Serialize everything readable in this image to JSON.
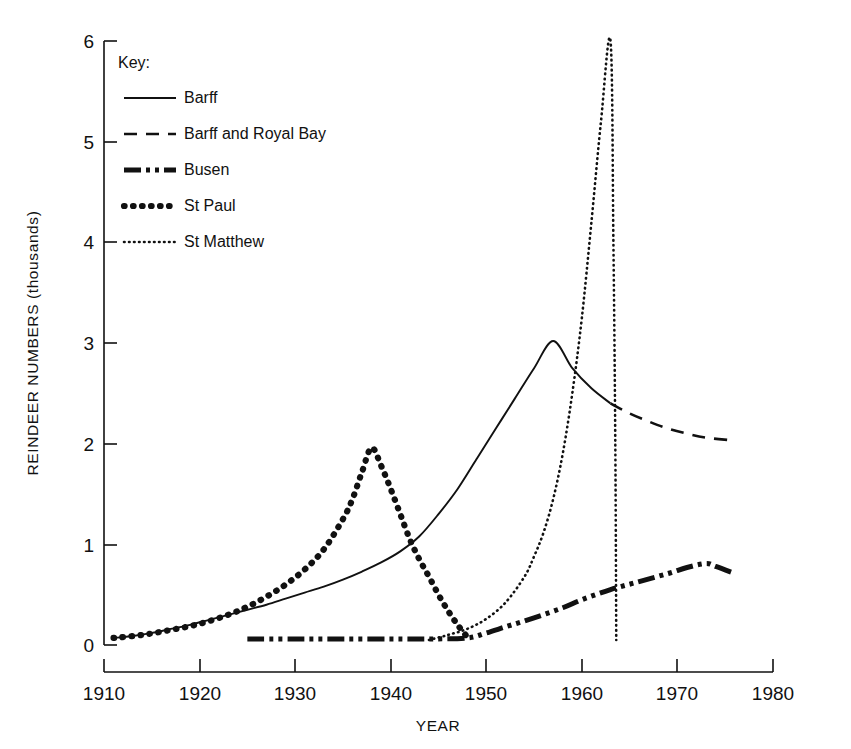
{
  "chart_data": {
    "type": "line",
    "title": "",
    "xlabel": "YEAR",
    "ylabel": "REINDEER NUMBERS (thousands)",
    "xlim": [
      1910,
      1980
    ],
    "ylim": [
      0,
      6
    ],
    "xticks": [
      "1910",
      "1920",
      "1930",
      "1940",
      "1950",
      "1960",
      "1970",
      "1980"
    ],
    "yticks": [
      "0",
      "1",
      "2",
      "3",
      "4",
      "5",
      "6"
    ],
    "grid": false,
    "legend_position": "upper-left-inside",
    "legend_title": "Key:",
    "series": [
      {
        "name": "Barff",
        "style": "solid",
        "points": [
          [
            1911,
            0.07
          ],
          [
            1913,
            0.09
          ],
          [
            1915,
            0.12
          ],
          [
            1917,
            0.16
          ],
          [
            1919,
            0.2
          ],
          [
            1921,
            0.25
          ],
          [
            1923,
            0.3
          ],
          [
            1925,
            0.35
          ],
          [
            1927,
            0.4
          ],
          [
            1929,
            0.46
          ],
          [
            1931,
            0.52
          ],
          [
            1933,
            0.58
          ],
          [
            1935,
            0.65
          ],
          [
            1937,
            0.73
          ],
          [
            1939,
            0.82
          ],
          [
            1941,
            0.93
          ],
          [
            1943,
            1.08
          ],
          [
            1945,
            1.3
          ],
          [
            1947,
            1.55
          ],
          [
            1949,
            1.85
          ],
          [
            1951,
            2.15
          ],
          [
            1953,
            2.45
          ],
          [
            1955,
            2.75
          ],
          [
            1957,
            3.02
          ],
          [
            1959,
            2.75
          ],
          [
            1961,
            2.55
          ],
          [
            1963,
            2.4
          ]
        ]
      },
      {
        "name": "Barff and Royal Bay",
        "style": "dashed",
        "points": [
          [
            1963,
            2.4
          ],
          [
            1965,
            2.3
          ],
          [
            1967,
            2.22
          ],
          [
            1969,
            2.15
          ],
          [
            1971,
            2.1
          ],
          [
            1973,
            2.06
          ],
          [
            1976,
            2.03
          ]
        ]
      },
      {
        "name": "Busen",
        "style": "dash-dot",
        "points": [
          [
            1925,
            0.06
          ],
          [
            1930,
            0.06
          ],
          [
            1935,
            0.06
          ],
          [
            1940,
            0.06
          ],
          [
            1944,
            0.06
          ],
          [
            1948,
            0.07
          ],
          [
            1950,
            0.12
          ],
          [
            1952,
            0.18
          ],
          [
            1955,
            0.27
          ],
          [
            1958,
            0.37
          ],
          [
            1960,
            0.45
          ],
          [
            1963,
            0.55
          ],
          [
            1966,
            0.63
          ],
          [
            1969,
            0.71
          ],
          [
            1971,
            0.77
          ],
          [
            1973,
            0.81
          ],
          [
            1974,
            0.78
          ],
          [
            1976,
            0.71
          ]
        ]
      },
      {
        "name": "St Paul",
        "style": "dotted-thick",
        "points": [
          [
            1911,
            0.07
          ],
          [
            1914,
            0.1
          ],
          [
            1917,
            0.15
          ],
          [
            1920,
            0.21
          ],
          [
            1923,
            0.3
          ],
          [
            1925,
            0.38
          ],
          [
            1927,
            0.48
          ],
          [
            1929,
            0.6
          ],
          [
            1931,
            0.75
          ],
          [
            1933,
            0.95
          ],
          [
            1935,
            1.25
          ],
          [
            1936,
            1.45
          ],
          [
            1937,
            1.72
          ],
          [
            1938,
            1.96
          ],
          [
            1939,
            1.78
          ],
          [
            1940,
            1.55
          ],
          [
            1941,
            1.3
          ],
          [
            1942,
            1.05
          ],
          [
            1943,
            0.85
          ],
          [
            1944,
            0.68
          ],
          [
            1945,
            0.5
          ],
          [
            1946,
            0.34
          ],
          [
            1947,
            0.2
          ],
          [
            1948,
            0.08
          ]
        ]
      },
      {
        "name": "St Matthew",
        "style": "dotted-fine",
        "points": [
          [
            1944,
            0.05
          ],
          [
            1946,
            0.1
          ],
          [
            1948,
            0.16
          ],
          [
            1950,
            0.26
          ],
          [
            1952,
            0.42
          ],
          [
            1954,
            0.68
          ],
          [
            1955,
            0.88
          ],
          [
            1956,
            1.12
          ],
          [
            1957,
            1.45
          ],
          [
            1958,
            1.9
          ],
          [
            1959,
            2.5
          ],
          [
            1960,
            3.25
          ],
          [
            1961,
            4.2
          ],
          [
            1962,
            5.2
          ],
          [
            1963,
            6.0
          ],
          [
            1963.3,
            4.0
          ],
          [
            1963.5,
            2.0
          ],
          [
            1963.6,
            0.05
          ]
        ]
      }
    ]
  },
  "legend": {
    "title": "Key:",
    "entries": [
      {
        "label": "Barff",
        "style": "solid"
      },
      {
        "label": "Barff and Royal Bay",
        "style": "dashed"
      },
      {
        "label": "Busen",
        "style": "dash-dot"
      },
      {
        "label": "St Paul",
        "style": "dotted-thick"
      },
      {
        "label": "St Matthew",
        "style": "dotted-fine"
      }
    ]
  },
  "colors": {
    "ink": "#111111",
    "background": "#ffffff"
  }
}
